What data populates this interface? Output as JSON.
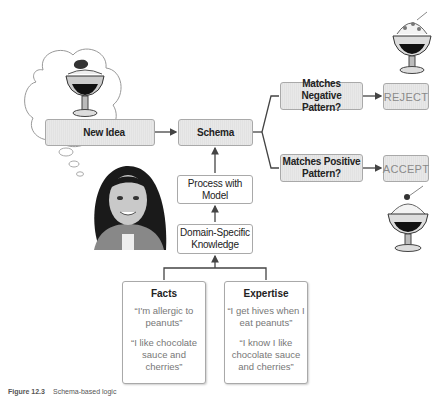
{
  "diagram": {
    "nodes": {
      "new_idea": "New Idea",
      "schema": "Schema",
      "negative": "Matches Negative Pattern?",
      "positive": "Matches Positive Pattern?",
      "reject": "REJECT",
      "accept": "ACCEPT",
      "process": "Process with Model",
      "domain": "Domain-Specific Knowledge"
    },
    "facts": {
      "title": "Facts",
      "items": [
        "“I'm allergic to peanuts”",
        "“I like chocolate sauce and cherries”"
      ]
    },
    "expertise": {
      "title": "Expertise",
      "items": [
        "“I get hives when I eat peanuts”",
        "“I know I like chocolate sauce and cherries”"
      ]
    },
    "illustrations": {
      "thought_bubble": "sundae-in-thought-bubble",
      "person": "girl-portrait",
      "reject_image": "sundae-with-nuts",
      "accept_image": "sundae-with-cherry"
    }
  },
  "caption": {
    "label": "Figure 12.3",
    "text": "Schema-based logic"
  },
  "colors": {
    "box_gray": "#e5e5e5",
    "border": "#a9a9a9",
    "line": "#444444",
    "result_text": "#8a8a8a"
  }
}
